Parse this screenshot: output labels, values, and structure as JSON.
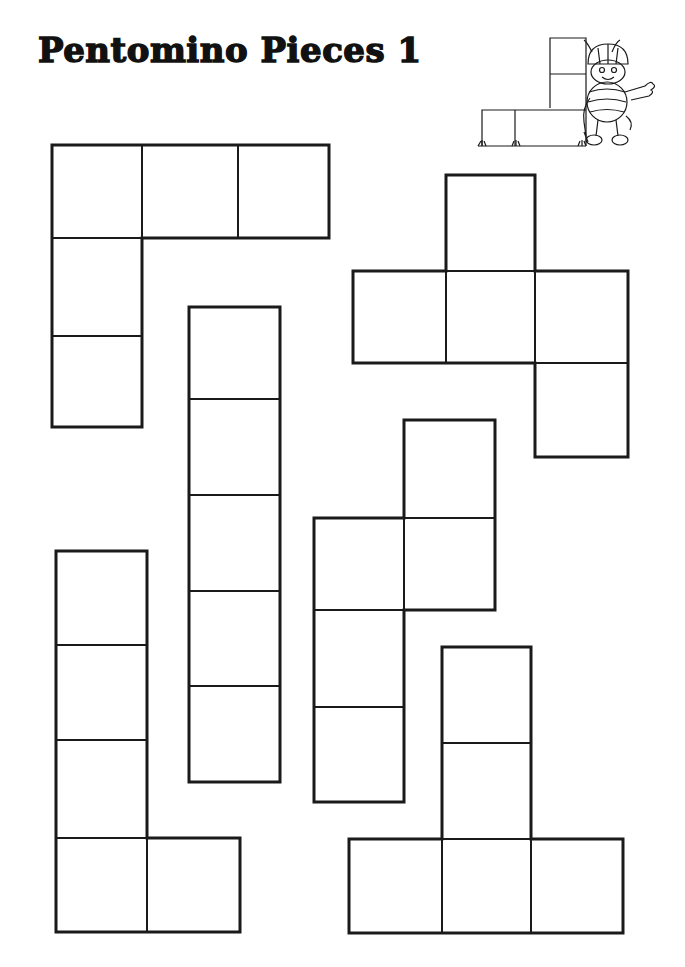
{
  "title": "Pentomino Pieces 1",
  "colors": {
    "ink": "#1a1a1a",
    "paper": "#ffffff"
  },
  "illustration": {
    "name": "bee-builder-mascot",
    "description": "Cartoon bee wearing a hard hat, waving, next to an L-shaped block outline"
  },
  "pieces": [
    {
      "name": "V-pentomino",
      "cells": [
        [
          52,
          145,
          90,
          93
        ],
        [
          142,
          145,
          96,
          93
        ],
        [
          238,
          145,
          91,
          93
        ],
        [
          52,
          238,
          90,
          98
        ],
        [
          52,
          336,
          90,
          91
        ]
      ],
      "outline": "52,145 329,145 329,238 142,238 142,427 52,427"
    },
    {
      "name": "F-pentomino",
      "cells": [
        [
          446,
          175,
          89,
          96
        ],
        [
          353,
          271,
          93,
          92
        ],
        [
          446,
          271,
          89,
          92
        ],
        [
          535,
          271,
          93,
          92
        ],
        [
          535,
          363,
          93,
          94
        ]
      ],
      "outline": "446,175 535,175 535,271 628,271 628,457 535,457 535,363 353,363 353,271 446,271"
    },
    {
      "name": "I-pentomino",
      "cells": [
        [
          189,
          307,
          91,
          92
        ],
        [
          189,
          399,
          91,
          96
        ],
        [
          189,
          495,
          91,
          96
        ],
        [
          189,
          591,
          91,
          95
        ],
        [
          189,
          686,
          91,
          96
        ]
      ],
      "outline": "189,307 280,307 280,782 189,782"
    },
    {
      "name": "P-pentomino",
      "cells": [
        [
          404,
          420,
          91,
          98
        ],
        [
          314,
          518,
          90,
          92
        ],
        [
          404,
          518,
          91,
          92
        ],
        [
          314,
          610,
          90,
          97
        ],
        [
          314,
          707,
          90,
          95
        ]
      ],
      "outline": "404,420 495,420 495,610 404,610 404,802 314,802 314,518 404,518"
    },
    {
      "name": "L-pentomino",
      "cells": [
        [
          56,
          551,
          91,
          94
        ],
        [
          56,
          645,
          91,
          95
        ],
        [
          56,
          740,
          91,
          98
        ],
        [
          56,
          838,
          91,
          94
        ],
        [
          147,
          838,
          93,
          94
        ]
      ],
      "outline": "56,551 147,551 147,838 240,838 240,932 56,932"
    },
    {
      "name": "T-pentomino",
      "cells": [
        [
          442,
          647,
          89,
          96
        ],
        [
          442,
          743,
          89,
          96
        ],
        [
          349,
          839,
          93,
          94
        ],
        [
          442,
          839,
          89,
          94
        ],
        [
          531,
          839,
          92,
          94
        ]
      ],
      "outline": "442,647 531,647 531,839 623,839 623,933 349,933 349,839 442,839"
    }
  ]
}
